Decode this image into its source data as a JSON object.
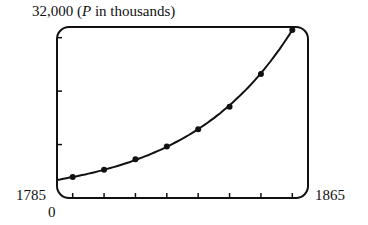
{
  "chart_data": {
    "type": "line",
    "title": "",
    "ylabel": "P in thousands",
    "xlabel": "",
    "x_range": [
      1785,
      1865
    ],
    "ylim": [
      0,
      32000
    ],
    "grid": false,
    "y_ticks": [
      10000,
      20000,
      30000
    ],
    "x_ticks": [
      1790,
      1800,
      1810,
      1820,
      1830,
      1840,
      1850,
      1860
    ],
    "labels": {
      "y_max": "32,000",
      "y_unit_prefix": "(",
      "y_unit_var": "P",
      "y_unit_rest": " in thousands)",
      "x_min": "1785",
      "y_min": "0",
      "x_max": "1865"
    },
    "series": [
      {
        "name": "Population (scatter points)",
        "x": [
          1790,
          1800,
          1810,
          1820,
          1830,
          1840,
          1850,
          1860
        ],
        "values": [
          3929,
          5308,
          7240,
          9638,
          12866,
          17069,
          23192,
          31443
        ]
      },
      {
        "name": "Fitted exponential curve",
        "kind": "curve"
      }
    ]
  }
}
